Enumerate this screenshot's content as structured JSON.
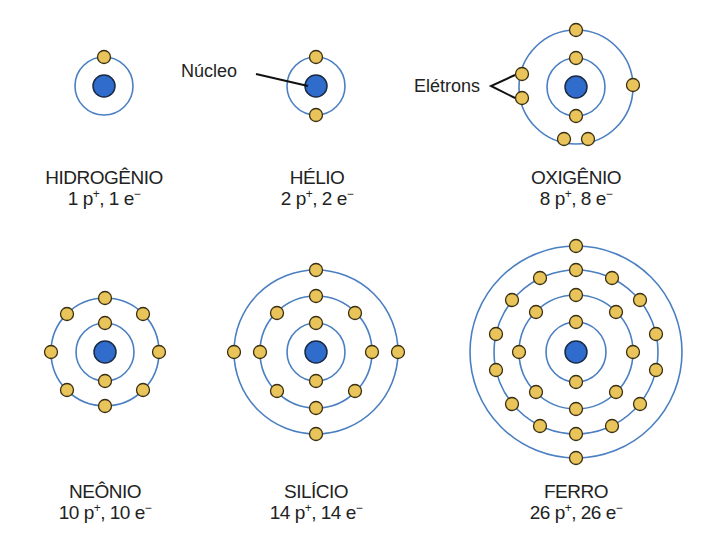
{
  "colors": {
    "orbit": "#4a7fc1",
    "nucleus": "#2f6ccc",
    "electron": "#e8c45a",
    "outline": "#3a2e10",
    "text": "#222222"
  },
  "callouts": {
    "nucleus": "Núcleo",
    "electrons": "Elétrons"
  },
  "atoms": [
    {
      "name": "HIDROGÊNIO",
      "protons": "1",
      "electrons": "1",
      "p_unit": "p",
      "e_unit": "e",
      "p_sign": "+",
      "e_sign": "−",
      "shells": [
        1
      ]
    },
    {
      "name": "HÉLIO",
      "protons": "2",
      "electrons": "2",
      "p_unit": "p",
      "e_unit": "e",
      "p_sign": "+",
      "e_sign": "−",
      "shells": [
        2
      ]
    },
    {
      "name": "OXIGÊNIO",
      "protons": "8",
      "electrons": "8",
      "p_unit": "p",
      "e_unit": "e",
      "p_sign": "+",
      "e_sign": "−",
      "shells": [
        2,
        6
      ]
    },
    {
      "name": "NEÔNIO",
      "protons": "10",
      "electrons": "10",
      "p_unit": "p",
      "e_unit": "e",
      "p_sign": "+",
      "e_sign": "−",
      "shells": [
        2,
        8
      ]
    },
    {
      "name": "SILÍCIO",
      "protons": "14",
      "electrons": "14",
      "p_unit": "p",
      "e_unit": "e",
      "p_sign": "+",
      "e_sign": "−",
      "shells": [
        2,
        8,
        4
      ]
    },
    {
      "name": "FERRO",
      "protons": "26",
      "electrons": "26",
      "p_unit": "p",
      "e_unit": "e",
      "p_sign": "+",
      "e_sign": "−",
      "shells": [
        2,
        8,
        14,
        2
      ]
    }
  ]
}
